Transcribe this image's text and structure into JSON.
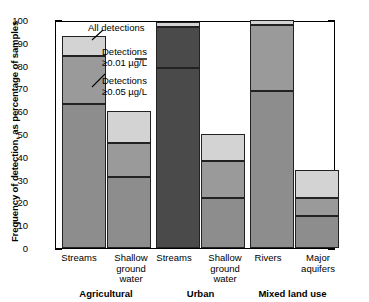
{
  "chart_data": {
    "type": "bar",
    "subtype": "stacked-nested-threshold",
    "title": "",
    "xlabel": "",
    "ylabel": "Frequency of detection, as percentage of samples",
    "ylim": [
      0,
      100
    ],
    "ytick_values": [
      0,
      10,
      20,
      30,
      40,
      50,
      60,
      70,
      80,
      90,
      100
    ],
    "ytick_labels": [
      "0",
      "10",
      "20",
      "30",
      "40",
      "50",
      "60",
      "70",
      "80",
      "90",
      "100"
    ],
    "yminor_step": 2,
    "grid": false,
    "legend_position": "inside-plot-annotations",
    "series": [
      {
        "name": "All detections",
        "key": "all",
        "color": "#d3d3d3",
        "values": [
          93,
          60,
          99,
          50,
          100,
          34
        ]
      },
      {
        "name": "Detections ≥0.01 µg/L",
        "key": "p01",
        "color": "#9a9a9a",
        "values": [
          84,
          46,
          97,
          38,
          98,
          22
        ]
      },
      {
        "name": "Detections ≥0.05 µg/L",
        "key": "p05",
        "color": "#8d8d8d",
        "values": [
          63,
          31,
          79,
          22,
          69,
          14
        ]
      }
    ],
    "bars": [
      {
        "category": "Streams",
        "group": "Agricultural",
        "all": 93,
        "p01": 84,
        "p05": 63,
        "dark": false
      },
      {
        "category": "Shallow ground water",
        "group": "Agricultural",
        "all": 60,
        "p01": 46,
        "p05": 31,
        "dark": false
      },
      {
        "category": "Streams",
        "group": "Urban",
        "all": 99,
        "p01": 97,
        "p05": 79,
        "dark": true
      },
      {
        "category": "Shallow ground water",
        "group": "Urban",
        "all": 50,
        "p01": 38,
        "p05": 22,
        "dark": false
      },
      {
        "category": "Rivers",
        "group": "Mixed land use",
        "all": 100,
        "p01": 98,
        "p05": 69,
        "dark": false
      },
      {
        "category": "Major aquifers",
        "group": "Mixed land use",
        "all": 34,
        "p01": 22,
        "p05": 14,
        "dark": false
      }
    ],
    "groups": [
      {
        "label": "Agricultural",
        "categories": [
          "Streams",
          "Shallow ground water"
        ]
      },
      {
        "label": "Urban",
        "categories": [
          "Streams",
          "Shallow ground water"
        ]
      },
      {
        "label": "Mixed land use",
        "categories": [
          "Rivers",
          "Major aquifers"
        ]
      }
    ],
    "annotations": [
      {
        "text": "All detections"
      },
      {
        "text": "Detections",
        "text2": "≥0.01 µg/L"
      },
      {
        "text": "Detections",
        "text2": "≥0.05 µg/L"
      }
    ]
  },
  "axis": {
    "ylabel": "Frequency of detection, as percentage of samples",
    "ytick_0": "0",
    "ytick_10": "10",
    "ytick_20": "20",
    "ytick_30": "30",
    "ytick_40": "40",
    "ytick_50": "50",
    "ytick_60": "60",
    "ytick_70": "70",
    "ytick_80": "80",
    "ytick_90": "90",
    "ytick_100": "100"
  },
  "xlabels": {
    "b0_line1": "Streams",
    "b1_line1": "Shallow",
    "b1_line2": "ground",
    "b1_line3": "water",
    "b2_line1": "Streams",
    "b3_line1": "Shallow",
    "b3_line2": "ground",
    "b3_line3": "water",
    "b4_line1": "Rivers",
    "b5_line1": "Major",
    "b5_line2": "aquifers"
  },
  "groups": {
    "g0": "Agricultural",
    "g1": "Urban",
    "g2": "Mixed land use"
  },
  "annotations": {
    "all_detections": "All detections",
    "det001_line1": "Detections",
    "det001_line2": "≥0.01 µg/L",
    "det005_line1": "Detections",
    "det005_line2": "≥0.05 µg/L"
  },
  "colors": {
    "all": "#d3d3d3",
    "p01": "#9a9a9a",
    "p05": "#8d8d8d",
    "p05_dark": "#4a4a4a",
    "axis": "#000000"
  }
}
